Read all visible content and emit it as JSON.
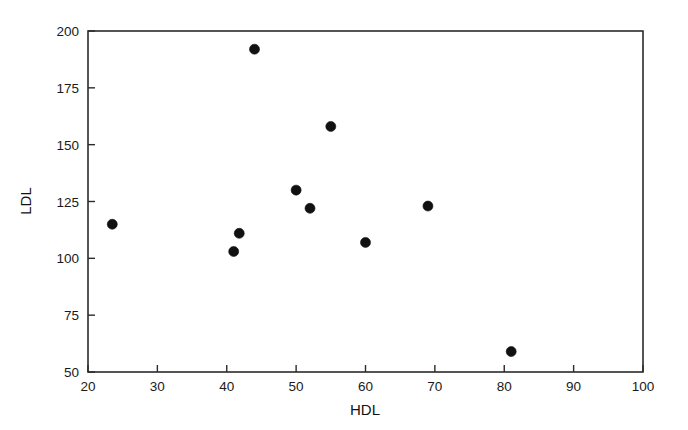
{
  "chart_data": {
    "type": "scatter",
    "title": "",
    "xlabel": "HDL",
    "ylabel": "LDL",
    "xlim": [
      20,
      100
    ],
    "ylim": [
      50,
      200
    ],
    "xticks": [
      20,
      30,
      40,
      50,
      60,
      70,
      80,
      90,
      100
    ],
    "xtick_labels": [
      "20",
      "30",
      "40",
      "50",
      "60",
      "70",
      "80",
      "90",
      "100"
    ],
    "yticks": [
      50,
      75,
      100,
      125,
      150,
      175,
      200
    ],
    "ytick_labels": [
      "50",
      "75",
      "100",
      "125",
      "150",
      "175",
      "200"
    ],
    "grid": false,
    "legend": null,
    "marker": "filled-circle",
    "marker_color": "#111111",
    "x": [
      23.5,
      41.0,
      41.8,
      44.0,
      50.0,
      52.0,
      55.0,
      60.0,
      69.0,
      81.0
    ],
    "y": [
      115,
      103,
      111,
      192,
      130,
      122,
      158,
      107,
      123,
      59
    ],
    "points": [
      {
        "x": 23.5,
        "y": 115
      },
      {
        "x": 41.0,
        "y": 103
      },
      {
        "x": 41.8,
        "y": 111
      },
      {
        "x": 44.0,
        "y": 192
      },
      {
        "x": 50.0,
        "y": 130
      },
      {
        "x": 52.0,
        "y": 122
      },
      {
        "x": 55.0,
        "y": 158
      },
      {
        "x": 60.0,
        "y": 107
      },
      {
        "x": 69.0,
        "y": 123
      },
      {
        "x": 81.0,
        "y": 59
      }
    ]
  },
  "axes": {
    "x_title": "HDL",
    "y_title": "LDL"
  }
}
